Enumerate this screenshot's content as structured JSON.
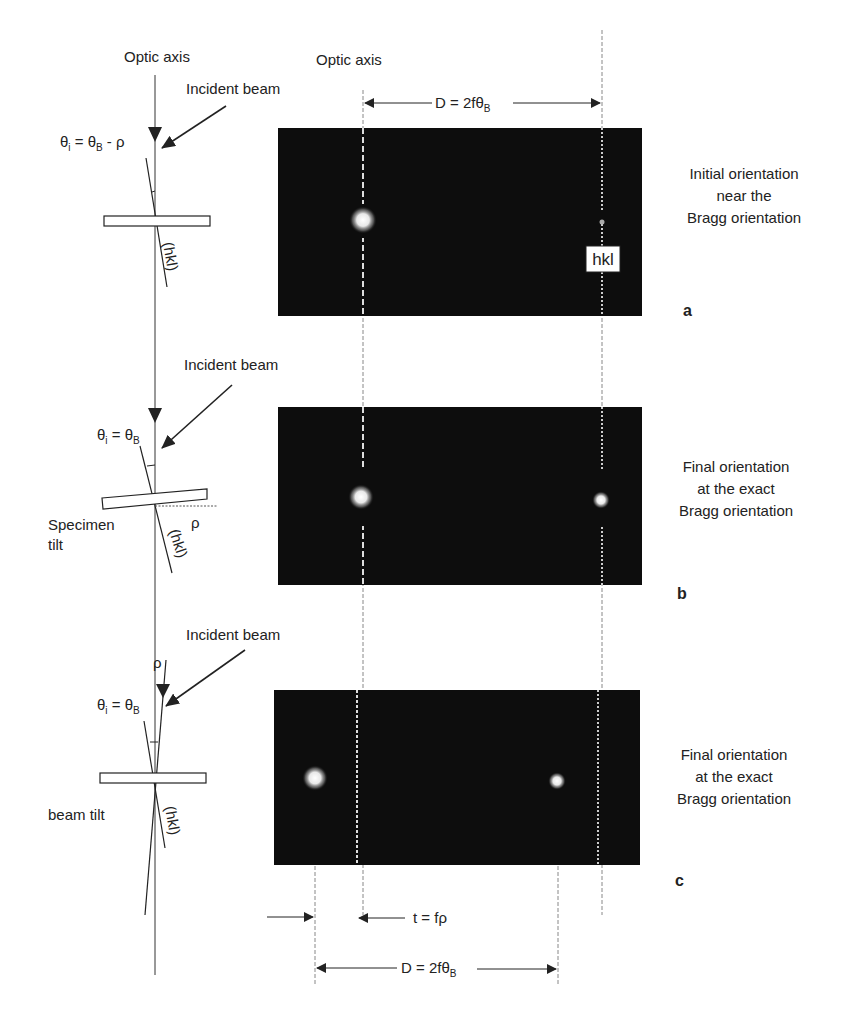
{
  "figure": {
    "left_column": {
      "optic_axis_label": "Optic axis",
      "panel_a": {
        "incident_beam": "Incident beam",
        "theta_i": "θ",
        "theta_i_sub": "i",
        "eq": " = θ",
        "eq_sub": "B",
        "eq_tail": " - ρ",
        "plane_label": "(hkl)"
      },
      "panel_b": {
        "incident_beam": "Incident beam",
        "theta_i": "θ",
        "theta_i_sub": "i",
        "eq": " = θ",
        "eq_sub": "B",
        "tilt_label_1": "Specimen",
        "tilt_label_2": "tilt",
        "rho": "ρ",
        "plane_label": "(hkl)"
      },
      "panel_c": {
        "incident_beam": "Incident beam",
        "theta_i": "θ",
        "theta_i_sub": "i",
        "eq": " = θ",
        "eq_sub": "B",
        "rho": "ρ",
        "tilt_label": "beam tilt",
        "plane_label": "(hkl)"
      }
    },
    "right_column": {
      "optic_axis_label": "Optic axis",
      "top_dimension": {
        "text": "D = 2fθ",
        "sub": "B"
      },
      "panels": [
        {
          "letter": "a",
          "caption": [
            "Initial orientation",
            "near the",
            "Bragg orientation"
          ],
          "spot_label": "hkl"
        },
        {
          "letter": "b",
          "caption": [
            "Final orientation",
            "at the exact",
            "Bragg orientation"
          ]
        },
        {
          "letter": "c",
          "caption": [
            "Final orientation",
            "at the exact",
            "Bragg orientation"
          ]
        }
      ],
      "bottom_dimensions": {
        "t": "t = fρ",
        "D": "D = 2fθ",
        "D_sub": "B"
      }
    },
    "colors": {
      "pattern_bg": "#0d0d0d",
      "spot": "#f2f2f2",
      "line": "#222222"
    }
  }
}
